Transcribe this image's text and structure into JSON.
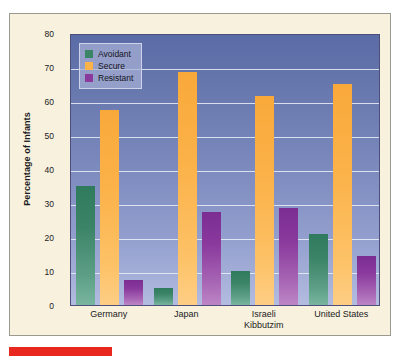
{
  "figure": {
    "background_color": "#f7f1de",
    "frame_color": "#9b9a91",
    "caption_marker_color": "#e8271f"
  },
  "legend": {
    "position": "top-left inside plot",
    "entries": [
      {
        "label": "Avoidant",
        "color": "#3c8468"
      },
      {
        "label": "Secure",
        "color": "#fbb249"
      },
      {
        "label": "Resistant",
        "color": "#8a3a9d"
      }
    ]
  },
  "axes": {
    "ylabel": "Percentage of Infants",
    "yticks": [
      0,
      10,
      20,
      30,
      40,
      50,
      60,
      70,
      80
    ],
    "ylim": [
      0,
      80
    ],
    "xlabel": ""
  },
  "chart_data": {
    "type": "bar",
    "title": "",
    "subtitle": "",
    "xlabel": "",
    "ylabel": "Percentage of Infants",
    "ylim": [
      0,
      80
    ],
    "yticks": [
      0,
      10,
      20,
      30,
      40,
      50,
      60,
      70,
      80
    ],
    "grid": true,
    "legend_position": "upper left",
    "categories": [
      "Germany",
      "Japan",
      "Israeli Kibbutzim",
      "United States"
    ],
    "category_lines": [
      [
        "Germany"
      ],
      [
        "Japan"
      ],
      [
        "Israeli",
        "Kibbutzim"
      ],
      [
        "United States"
      ]
    ],
    "series": [
      {
        "name": "Avoidant",
        "color": "#3c8468",
        "values": [
          35,
          5,
          10,
          21
        ]
      },
      {
        "name": "Secure",
        "color": "#fbb249",
        "values": [
          57.5,
          68.5,
          61.5,
          65
        ]
      },
      {
        "name": "Resistant",
        "color": "#8a3a9d",
        "values": [
          7.5,
          27.5,
          28.5,
          14.5
        ]
      }
    ]
  }
}
